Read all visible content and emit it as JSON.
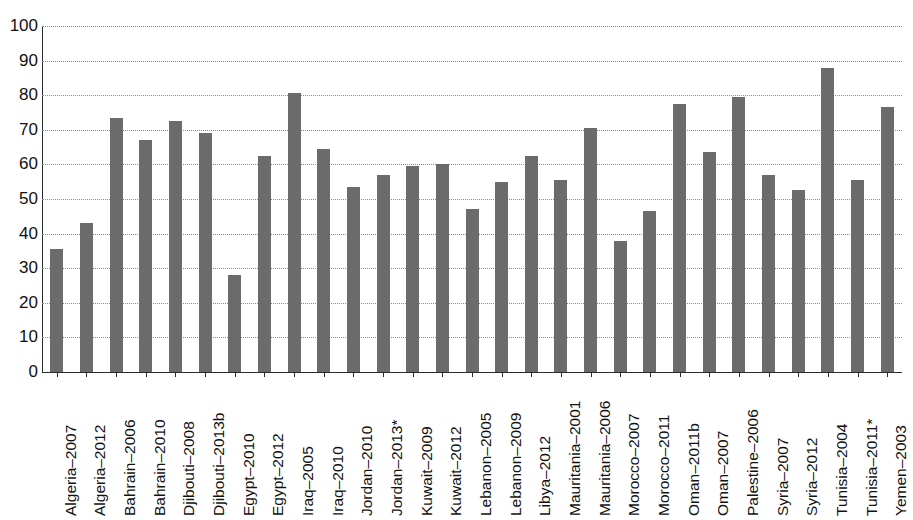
{
  "chart": {
    "title": "",
    "title_note": "clipped-partial-heading"
  },
  "chart_data": {
    "type": "bar",
    "title": "",
    "xlabel": "",
    "ylabel": "",
    "ylim": [
      0,
      100
    ],
    "ytick_labels": [
      "100",
      "90",
      "80",
      "70",
      "60",
      "50",
      "40",
      "30",
      "20",
      "10",
      "0"
    ],
    "ytick_values": [
      100,
      90,
      80,
      70,
      60,
      50,
      40,
      30,
      20,
      10,
      0
    ],
    "grid": true,
    "legend": "none",
    "bar_color": "#6b6b6b",
    "categories": [
      "Algeria–2007",
      "Algeria–2012",
      "Bahrain–2006",
      "Bahrain–2010",
      "Djibouti–2008",
      "Djibouti–2013b",
      "Egypt–2010",
      "Egypt–2012",
      "Iraq–2005",
      "Iraq–2010",
      "Jordan–2010",
      "Jordan–2013*",
      "Kuwait–2009",
      "Kuwait–2012",
      "Lebanon–2005",
      "Lebanon–2009",
      "Libya–2012",
      "Mauritania–2001",
      "Mauritania–2006",
      "Morocco–2007",
      "Morocco–2011",
      "Oman–2011b",
      "Oman–2007",
      "Palestine–2006",
      "Syria–2007",
      "Syria–2012",
      "Tunisia–2004",
      "Tunisia–2011*",
      "Yemen–2003"
    ],
    "values": [
      35.5,
      43.0,
      73.5,
      67.0,
      72.5,
      69.0,
      28.0,
      62.5,
      80.5,
      64.5,
      53.5,
      57.0,
      59.5,
      60.0,
      47.0,
      55.0,
      62.5,
      55.5,
      70.5,
      38.0,
      46.5,
      77.5,
      63.5,
      79.5,
      57.0,
      52.5,
      88.0,
      55.5,
      76.5
    ]
  }
}
